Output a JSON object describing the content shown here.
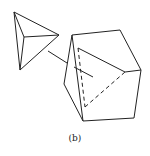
{
  "figure": {
    "caption": "(b)",
    "stroke_color": "#222222",
    "background": "#ffffff"
  },
  "tetrahedron": {
    "vertices": {
      "top": [
        14,
        12
      ],
      "right": [
        59,
        35
      ],
      "bottom": [
        20,
        70
      ],
      "inner": [
        24,
        37
      ]
    }
  },
  "cube": {
    "vertices": {
      "top_left": [
        72,
        35
      ],
      "top_right": [
        120,
        30
      ],
      "right": [
        141,
        70
      ],
      "bottom_right": [
        134,
        118
      ],
      "bottom": [
        83,
        121
      ],
      "left": [
        64,
        84
      ],
      "inner_top": [
        78,
        48
      ],
      "inner_right": [
        125,
        72
      ],
      "inner_bottom": [
        85,
        107
      ]
    }
  }
}
